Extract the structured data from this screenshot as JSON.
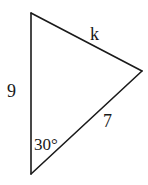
{
  "diagram": {
    "type": "triangle",
    "stroke_color": "#1a1a1a",
    "background": "#ffffff",
    "vertices": {
      "top": {
        "x": 31,
        "y": 13
      },
      "right": {
        "x": 142,
        "y": 71
      },
      "bottom": {
        "x": 31,
        "y": 174
      }
    },
    "sides": {
      "left": {
        "label": "9",
        "from": "top",
        "to": "bottom"
      },
      "top_right": {
        "label": "k",
        "from": "top",
        "to": "right"
      },
      "bottom_right": {
        "label": "7",
        "from": "bottom",
        "to": "right"
      }
    },
    "angles": {
      "bottom": {
        "label": "30°",
        "vertex": "bottom"
      }
    }
  }
}
